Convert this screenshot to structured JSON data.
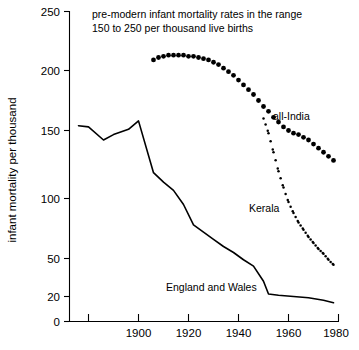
{
  "chart_data": {
    "type": "line",
    "title_line1": "pre-modern infant mortality rates in the range",
    "title_line2": "150 to 250 per thousand live births",
    "xlabel": "",
    "ylabel": "infant mortality per thousand",
    "xlim": [
      1876,
      1980
    ],
    "ylim": [
      0,
      250
    ],
    "grid": false,
    "legend": "inline-labels",
    "y_ticks": [
      0,
      20,
      50,
      100,
      150,
      200,
      250
    ],
    "y_tick_labels": [
      "0",
      "20",
      "50",
      "100",
      "150",
      "200",
      "250"
    ],
    "x_ticks": [
      1880,
      1900,
      1920,
      1940,
      1960,
      1980
    ],
    "x_tick_labels": [
      "",
      "1900",
      "1920",
      "1940",
      "1960",
      "1980"
    ],
    "series": [
      {
        "name": "all-India",
        "style": "dotted-large",
        "label": "all-India",
        "x": [
          1906,
          1908,
          1910,
          1912,
          1914,
          1916,
          1918,
          1920,
          1922,
          1924,
          1926,
          1928,
          1930,
          1932,
          1934,
          1936,
          1938,
          1940,
          1942,
          1944,
          1946,
          1948,
          1950,
          1952,
          1954,
          1956,
          1958,
          1960,
          1962,
          1964,
          1966,
          1968,
          1970,
          1972,
          1974,
          1976,
          1978
        ],
        "values": [
          209,
          211,
          212,
          213,
          213,
          213,
          213,
          212,
          212,
          211,
          210,
          209,
          207,
          205,
          202,
          199,
          196,
          192,
          188,
          184,
          180,
          175,
          170,
          166,
          161,
          157,
          153,
          150,
          148,
          147,
          145,
          143,
          140,
          137,
          134,
          131,
          128
        ]
      },
      {
        "name": "Kerala",
        "style": "dotted-small",
        "label": "Kerala",
        "x": [
          1950,
          1952,
          1954,
          1956,
          1958,
          1960,
          1962,
          1964,
          1966,
          1968,
          1970,
          1972,
          1974,
          1976,
          1978
        ],
        "values": [
          160,
          148,
          134,
          120,
          108,
          97,
          88,
          80,
          74,
          68,
          63,
          58,
          54,
          49,
          45
        ]
      },
      {
        "name": "England and Wales",
        "style": "solid",
        "label": "England and Wales",
        "x": [
          1876,
          1880,
          1886,
          1890,
          1896,
          1900,
          1906,
          1910,
          1914,
          1918,
          1922,
          1926,
          1930,
          1934,
          1938,
          1942,
          1946,
          1950,
          1952,
          1956,
          1962,
          1968,
          1974,
          1978
        ],
        "values": [
          154,
          153,
          143,
          147,
          151,
          158,
          119,
          112,
          106,
          95,
          78,
          72,
          66,
          60,
          55,
          49,
          44,
          32,
          22,
          21,
          20,
          19,
          17,
          15
        ]
      }
    ],
    "annotations": [
      {
        "text": "all-India",
        "x": 1958,
        "y": 156
      },
      {
        "text": "Kerala",
        "x": 1941,
        "y": 88
      },
      {
        "text": "England and Wales",
        "x": 1913,
        "y": 29
      }
    ]
  },
  "colors": {
    "axis": "#000000",
    "series": "#000000",
    "background": "#ffffff"
  }
}
